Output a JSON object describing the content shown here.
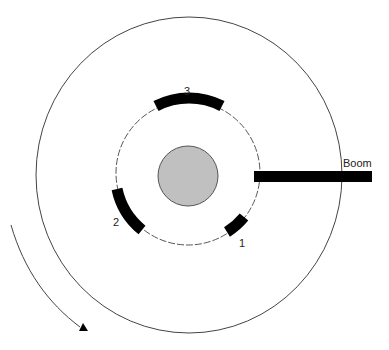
{
  "diagram": {
    "labels": {
      "boom": "Boom",
      "segment_1": "1",
      "segment_2": "2",
      "segment_3": "3"
    },
    "colors": {
      "stroke": "#333333",
      "segment_fill": "#000000",
      "hub_fill": "#c0c0c0"
    }
  }
}
